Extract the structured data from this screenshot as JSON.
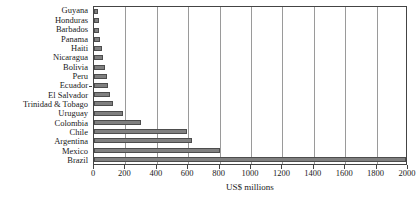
{
  "chart_data": {
    "type": "bar",
    "orientation": "horizontal",
    "title": "",
    "subtitle": "",
    "xlabel": "US$ millions",
    "ylabel": "",
    "xlim": [
      0,
      2000
    ],
    "xticks": [
      0,
      200,
      400,
      600,
      800,
      1000,
      1200,
      1400,
      1600,
      1800,
      2000
    ],
    "xtick_labels": [
      "0",
      "200",
      "400",
      "600",
      "800",
      "1000",
      "1200",
      "1400",
      "1600",
      "1800",
      "2000"
    ],
    "grid": "vertical",
    "legend": "none",
    "bar_color": "#808080",
    "bar_edge_color": "#4d4d4d",
    "categories": [
      "Guyana",
      "Honduras",
      "Barbados",
      "Panama",
      "Haiti",
      "Nicaragua",
      "Bolivia",
      "Peru",
      "Ecuador",
      "El Salvador",
      "Trinidad & Tobago",
      "Uruguay",
      "Colombia",
      "Chile",
      "Argentina",
      "Mexico",
      "Brazil"
    ],
    "values": [
      25,
      30,
      35,
      40,
      50,
      60,
      70,
      80,
      90,
      100,
      120,
      185,
      300,
      595,
      625,
      800,
      2000
    ]
  }
}
